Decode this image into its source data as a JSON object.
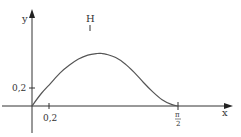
{
  "chart_data": {
    "type": "line",
    "title": "",
    "xlabel": "x",
    "ylabel": "y",
    "x_ticks": [
      {
        "value": 0.2,
        "label": "0,2"
      },
      {
        "value": 1.5708,
        "label_num": "π",
        "label_den": "2"
      }
    ],
    "y_ticks": [
      {
        "value": 0.2,
        "label": "0,2"
      }
    ],
    "annotations": [
      {
        "label": "H",
        "description": "maximum point of the curve",
        "x": 0.75,
        "y": 0.67
      }
    ],
    "xlim": [
      -0.3,
      2.0
    ],
    "ylim": [
      -0.2,
      0.75
    ],
    "grid": false,
    "legend": null,
    "series": [
      {
        "name": "f(x)",
        "x": [
          0,
          0.1,
          0.2,
          0.3,
          0.4,
          0.5,
          0.6,
          0.7,
          0.75,
          0.8,
          0.9,
          1.0,
          1.1,
          1.2,
          1.3,
          1.4,
          1.5,
          1.5708
        ],
        "values": [
          0,
          0.16,
          0.29,
          0.42,
          0.52,
          0.6,
          0.65,
          0.67,
          0.67,
          0.66,
          0.62,
          0.54,
          0.43,
          0.3,
          0.18,
          0.08,
          0.02,
          0
        ]
      }
    ]
  },
  "colors": {
    "axis": "#333333",
    "curve": "#555555",
    "text": "#333333"
  }
}
